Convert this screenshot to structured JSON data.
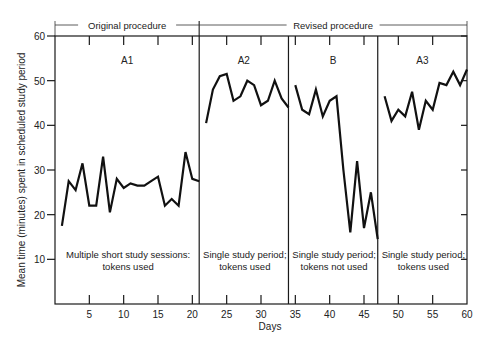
{
  "chart_data": {
    "type": "line",
    "title": "",
    "xlabel": "Days",
    "ylabel": "Mean time (minutes) spent in scheduled study period",
    "xlim": [
      0,
      60
    ],
    "ylim": [
      0,
      60
    ],
    "x_ticks": [
      5,
      10,
      15,
      20,
      25,
      30,
      35,
      40,
      45,
      50,
      55,
      60
    ],
    "y_ticks": [
      10,
      20,
      30,
      40,
      50,
      60
    ],
    "grid": false,
    "legend": null,
    "procedure_headers": [
      {
        "label": "Original procedure",
        "from_day": 0,
        "to_day": 21
      },
      {
        "label": "Revised procedure",
        "from_day": 21,
        "to_day": 60
      }
    ],
    "phase_dividers": [
      21,
      34,
      47
    ],
    "phases": [
      {
        "name": "A1",
        "description": [
          "Multiple short study sessions:",
          "tokens used"
        ],
        "from_day": 0,
        "to_day": 21
      },
      {
        "name": "A2",
        "description": [
          "Single study period;",
          "tokens used"
        ],
        "from_day": 21,
        "to_day": 34
      },
      {
        "name": "B",
        "description": [
          "Single study period;",
          "tokens not used"
        ],
        "from_day": 34,
        "to_day": 47
      },
      {
        "name": "A3",
        "description": [
          "Single study period;",
          "tokens used"
        ],
        "from_day": 47,
        "to_day": 60
      }
    ],
    "series": [
      {
        "name": "A1",
        "x": [
          1,
          2,
          3,
          4,
          5,
          6,
          7,
          8,
          9,
          10,
          11,
          12,
          13,
          14,
          15,
          16,
          17,
          18,
          19,
          20,
          21
        ],
        "values": [
          17.5,
          27.5,
          25.5,
          31.5,
          22,
          22,
          33,
          20.5,
          28,
          26,
          27,
          26.5,
          26.5,
          27.5,
          28.5,
          22,
          23.5,
          22,
          34,
          28,
          27.5
        ]
      },
      {
        "name": "A2",
        "x": [
          22,
          23,
          24,
          25,
          26,
          27,
          28,
          29,
          30,
          31,
          32,
          33,
          34
        ],
        "values": [
          40.5,
          48,
          51,
          51.5,
          45.5,
          46.5,
          50,
          49,
          44.5,
          45.5,
          50,
          46,
          44
        ]
      },
      {
        "name": "B",
        "x": [
          35,
          36,
          37,
          38,
          39,
          40,
          41,
          42,
          43,
          44,
          45,
          46,
          47
        ],
        "values": [
          49,
          43.5,
          42.5,
          48,
          42,
          45.5,
          46.5,
          30,
          16,
          32,
          17,
          25,
          14.5
        ]
      },
      {
        "name": "A3",
        "x": [
          48,
          49,
          50,
          51,
          52,
          53,
          54,
          55,
          56,
          57,
          58,
          59,
          60
        ],
        "values": [
          46.5,
          41,
          43.5,
          42,
          47.5,
          39,
          45.5,
          43.5,
          49.5,
          49,
          52,
          49,
          52.5
        ]
      }
    ]
  }
}
